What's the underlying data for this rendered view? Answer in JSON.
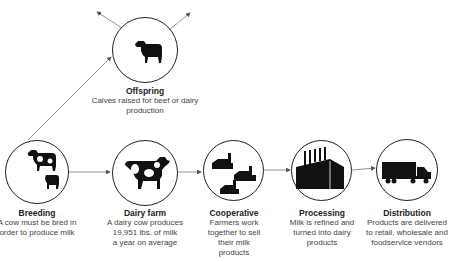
{
  "diagram": {
    "type": "flow",
    "nodes": [
      {
        "id": "offspring",
        "icon": "calf-icon",
        "title": "Offspring",
        "desc_lines": [
          "Calves raised for beef or dairy",
          "production"
        ]
      },
      {
        "id": "breeding",
        "icon": "cow-and-calf-icon",
        "title": "Breeding",
        "desc_lines": [
          "A cow must be bred in",
          "order to produce milk"
        ]
      },
      {
        "id": "dairy",
        "icon": "dairy-cow-icon",
        "title": "Dairy farm",
        "desc_lines": [
          "A dairy cow produces",
          "19,951 lbs. of milk",
          "a year on average"
        ]
      },
      {
        "id": "cooperative",
        "icon": "farm-buildings-icon",
        "title": "Cooperative",
        "desc_lines": [
          "Farmers work",
          "together to sell",
          "their milk",
          "products"
        ]
      },
      {
        "id": "processing",
        "icon": "factory-icon",
        "title": "Processing",
        "desc_lines": [
          "Milk is refined and",
          "turned into dairy",
          "products"
        ]
      },
      {
        "id": "distribution",
        "icon": "truck-icon",
        "title": "Distribution",
        "desc_lines": [
          "Products are delivered",
          "to retail, wholesale and",
          "foodservice vendors"
        ]
      }
    ],
    "edges": [
      {
        "from": "breeding",
        "to": "offspring"
      },
      {
        "from": "breeding",
        "to": "dairy"
      },
      {
        "from": "dairy",
        "to": "cooperative"
      },
      {
        "from": "cooperative",
        "to": "processing"
      },
      {
        "from": "processing",
        "to": "distribution"
      },
      {
        "from": "offspring",
        "to": "out-left"
      },
      {
        "from": "offspring",
        "to": "out-right"
      }
    ],
    "colors": {
      "line": "#666666",
      "ink": "#111111",
      "text": "#444444"
    }
  }
}
